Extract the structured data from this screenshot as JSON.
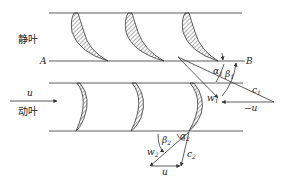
{
  "diagram": {
    "labels": {
      "stator": "静叶",
      "rotor": "动叶",
      "point_a": "A",
      "point_b": "B",
      "u_arrow": "u",
      "alpha1": "α",
      "alpha1_sub": "1",
      "beta1": "β",
      "beta1_sub": "1",
      "c1": "c",
      "c1_sub": "1",
      "w1": "w",
      "w1_sub": "1",
      "neg_u": "−u",
      "beta2": "β",
      "beta2_sub": "2",
      "alpha2": "α",
      "alpha2_sub": "2",
      "w2": "w",
      "w2_sub": "2",
      "c2": "c",
      "c2_sub": "2",
      "u_bottom": "u"
    },
    "colors": {
      "line": "#333333",
      "hatch": "#333333",
      "background": "#ffffff"
    }
  }
}
